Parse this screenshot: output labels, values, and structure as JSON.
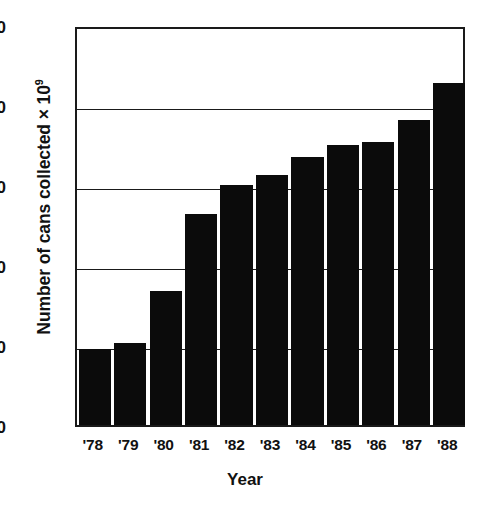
{
  "chart_data": {
    "type": "bar",
    "title": "",
    "xlabel": "Year",
    "ylabel": "Number of cans collected × 10",
    "ylabel_exponent": "9",
    "categories": [
      "'78",
      "'79",
      "'80",
      "'81",
      "'82",
      "'83",
      "'84",
      "'85",
      "'86",
      "'87",
      "'88"
    ],
    "values": [
      9.5,
      10.3,
      16.8,
      26.4,
      30.0,
      31.2,
      33.5,
      35.0,
      35.4,
      38.1,
      42.8
    ],
    "ylim": [
      0,
      50
    ],
    "yticks": [
      "0",
      "10",
      "20",
      "30",
      "40",
      "50"
    ],
    "ytick_values": [
      0,
      10,
      20,
      30,
      40,
      50
    ],
    "gridlines": [
      10,
      20,
      30,
      40
    ],
    "grid": true,
    "legend": "none",
    "bar_color": "#0b0b0b",
    "axis_color": "#1a1a1a",
    "background_color": "#ffffff"
  }
}
